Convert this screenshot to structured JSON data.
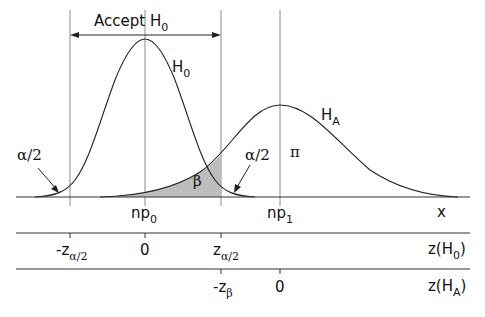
{
  "diagram": {
    "type": "hypothesis-test-power-diagram",
    "accept_region": {
      "label": "Accept H",
      "label_sub": "0"
    },
    "curves": [
      {
        "name": "H",
        "sub": "0",
        "center_label": "np0"
      },
      {
        "name": "H",
        "sub": "A",
        "center_label": "np1"
      }
    ],
    "region_labels": {
      "alpha_left": "α/2",
      "alpha_right": "α/2",
      "beta": "β",
      "power": "π"
    },
    "axes": {
      "x": {
        "name": "x",
        "ticks": [
          {
            "label": "np",
            "sub": "0"
          },
          {
            "label": "np",
            "sub": "1"
          }
        ]
      },
      "z_h0": {
        "name": "z(H",
        "name_sub": "0",
        "name_close": ")",
        "ticks": [
          {
            "label": "-z",
            "sub": "α/2"
          },
          {
            "label": "0",
            "sub": ""
          },
          {
            "label": "z",
            "sub": "α/2"
          }
        ]
      },
      "z_ha": {
        "name": "z(H",
        "name_sub": "A",
        "name_close": ")",
        "ticks": [
          {
            "label": "-z",
            "sub": "β"
          },
          {
            "label": "0",
            "sub": ""
          }
        ]
      }
    },
    "colors": {
      "line": "#222222",
      "shade": "#bdbdbd",
      "guide": "#888888"
    }
  }
}
